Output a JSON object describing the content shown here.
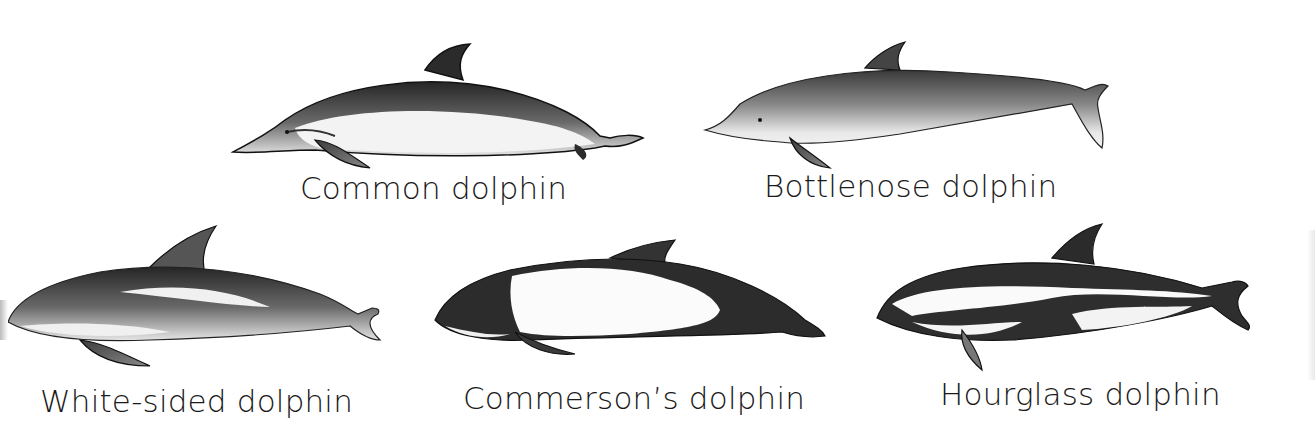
{
  "figure": {
    "dolphins": [
      {
        "id": "common",
        "label": "Common dolphin"
      },
      {
        "id": "bottlenose",
        "label": "Bottlenose dolphin"
      },
      {
        "id": "white-sided",
        "label": "White-sided dolphin"
      },
      {
        "id": "commersons",
        "label": "Commerson’s dolphin"
      },
      {
        "id": "hourglass",
        "label": "Hourglass dolphin"
      }
    ]
  },
  "colors": {
    "background": "#ffffff",
    "dark": "#2a2a2a",
    "mid": "#7a7a7a",
    "light": "#d8d8d8",
    "text": "#1a1a1a"
  }
}
